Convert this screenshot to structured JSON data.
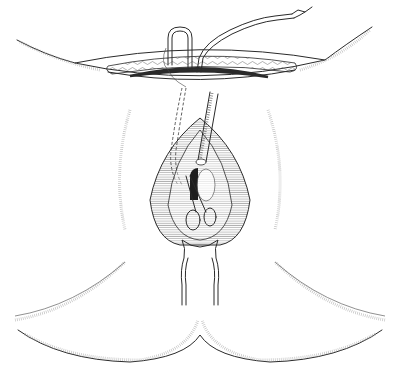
{
  "figure": {
    "type": "medical line illustration",
    "colors": {
      "line": "#2a2a2a",
      "background": "#ffffff",
      "dark_band": "#3a3a3a",
      "stipple": "#9a9a9a"
    },
    "labels": []
  }
}
